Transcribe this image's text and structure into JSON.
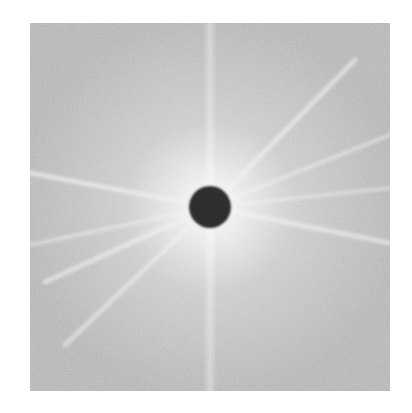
{
  "figure": {
    "frame": {
      "x": 30,
      "y": 23,
      "width": 360,
      "height": 368
    },
    "colors": {
      "page_background": "#ffffff",
      "base_gray": "#bdbdbd",
      "glow": "#f4f4f4",
      "ray": "#f2f2f2",
      "center_disk": "#2e2e2e"
    },
    "center": {
      "x": 210,
      "y": 207
    },
    "center_disk_radius": 21,
    "rays": [
      {
        "name": "upper-right-steep",
        "to_x": 355,
        "to_y": 60,
        "width": 5,
        "opacity": 0.55
      },
      {
        "name": "upper-right-shallow",
        "to_x": 390,
        "to_y": 135,
        "width": 4,
        "opacity": 0.5
      },
      {
        "name": "right-up",
        "to_x": 390,
        "to_y": 188,
        "width": 4,
        "opacity": 0.4
      },
      {
        "name": "right-down",
        "to_x": 390,
        "to_y": 243,
        "width": 5,
        "opacity": 0.55
      },
      {
        "name": "left-up",
        "to_x": 30,
        "to_y": 173,
        "width": 5,
        "opacity": 0.6
      },
      {
        "name": "left-down",
        "to_x": 30,
        "to_y": 245,
        "width": 4,
        "opacity": 0.45
      },
      {
        "name": "lower-left",
        "to_x": 45,
        "to_y": 282,
        "width": 5,
        "opacity": 0.55
      },
      {
        "name": "lower-left-steep",
        "to_x": 65,
        "to_y": 345,
        "width": 5,
        "opacity": 0.5
      }
    ],
    "vertical_band": {
      "x": 210,
      "width": 14,
      "opacity": 0.35
    }
  }
}
